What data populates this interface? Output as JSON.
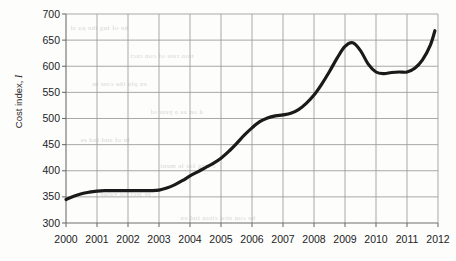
{
  "chart_data": {
    "type": "line",
    "title": "",
    "subtitle": "",
    "xlabel": "",
    "ylabel": "Cost index, I",
    "ylabel_text": "Cost index, ",
    "ylabel_symbol": "I",
    "xlim": [
      2000,
      2012
    ],
    "ylim": [
      300,
      700
    ],
    "xticks": [
      2000,
      2001,
      2002,
      2003,
      2004,
      2005,
      2006,
      2007,
      2008,
      2009,
      2010,
      2011,
      2012
    ],
    "xtick_labels": [
      "2000",
      "2001",
      "2002",
      "2003",
      "2004",
      "2005",
      "2006",
      "2007",
      "2008",
      "2009",
      "2010",
      "2011",
      "2012"
    ],
    "yticks": [
      300,
      350,
      400,
      450,
      500,
      550,
      600,
      650,
      700
    ],
    "ytick_labels": [
      "300",
      "350",
      "400",
      "450",
      "500",
      "550",
      "600",
      "650",
      "700"
    ],
    "grid": true,
    "grid_color": "#9a9a9a",
    "legend": null,
    "legend_position": "none",
    "line_color": "#1a1a1a",
    "line_width": 3.2,
    "series": [
      {
        "name": "Cost index",
        "x": [
          2000.0,
          2000.25,
          2000.5,
          2000.75,
          2001.0,
          2001.25,
          2001.5,
          2001.75,
          2002.0,
          2002.25,
          2002.5,
          2002.75,
          2003.0,
          2003.25,
          2003.5,
          2003.75,
          2004.0,
          2004.25,
          2004.5,
          2004.75,
          2005.0,
          2005.25,
          2005.5,
          2005.75,
          2006.0,
          2006.25,
          2006.5,
          2006.75,
          2007.0,
          2007.25,
          2007.5,
          2007.75,
          2008.0,
          2008.25,
          2008.5,
          2008.75,
          2009.0,
          2009.25,
          2009.5,
          2009.75,
          2010.0,
          2010.25,
          2010.5,
          2010.75,
          2011.0,
          2011.25,
          2011.5,
          2011.75,
          2011.9
        ],
        "y": [
          345,
          351,
          356,
          359,
          361,
          362,
          362,
          362,
          362,
          362,
          362,
          362,
          363,
          367,
          373,
          381,
          390,
          398,
          406,
          414,
          424,
          437,
          452,
          468,
          482,
          494,
          501,
          505,
          507,
          510,
          517,
          529,
          545,
          566,
          590,
          616,
          638,
          645,
          630,
          604,
          589,
          586,
          588,
          589,
          589,
          596,
          612,
          640,
          668
        ]
      }
    ],
    "key_points": [
      {
        "year": 2000,
        "value": 345,
        "note": "start"
      },
      {
        "year": 2001,
        "value": 361,
        "note": "plateau begins"
      },
      {
        "year": 2003,
        "value": 363,
        "note": "plateau ends"
      },
      {
        "year": 2005,
        "value": 424,
        "note": "rising"
      },
      {
        "year": 2006,
        "value": 482,
        "note": "rising"
      },
      {
        "year": 2007,
        "value": 507,
        "note": "brief plateau"
      },
      {
        "year": 2008.35,
        "value": 645,
        "note": "peak"
      },
      {
        "year": 2009.6,
        "value": 586,
        "note": "trough"
      },
      {
        "year": 2010.5,
        "value": 589,
        "note": "plateau"
      },
      {
        "year": 2011.9,
        "value": 678,
        "note": "end"
      }
    ]
  },
  "axes": {
    "y_axis_name": "y-axis",
    "x_axis_name": "x-axis"
  },
  "bleed_text": {
    "rows": [
      "he  of   ing  the  pa  al",
      "tion  rate   of  con   ruct",
      "ex   ple   the   cost   in",
      "d   on   as   a   year   of",
      "in   of   and   ind   es",
      "c   ting   for   le   ment",
      "pr   ject   tot   value",
      "he  con  stru  ction  ind  ex"
    ]
  }
}
